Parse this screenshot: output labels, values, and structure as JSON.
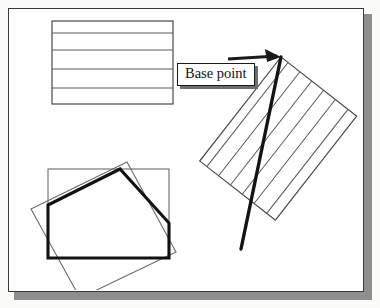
{
  "figure": {
    "name": "base-point-illustration",
    "kind": "cad-technical-drawing",
    "page_background": "#fbfbfa",
    "plate_background": "#ffffff",
    "plate_border_color": "#3b3b3b",
    "plate_shadow_color": "#8e8e8c",
    "ink_color": "#2a2a2a",
    "bold_ink_color": "#111111",
    "thin_ink_color": "#6b6b6b"
  },
  "callout": {
    "label": "Base point",
    "text_color": "#111111",
    "border_color": "#1a1a1a",
    "shadow_color": "#6f6f6d",
    "background": "#ffffff"
  },
  "shapes": {
    "top_rectangle": {
      "name": "horizontal-hatched-rectangle",
      "x": 51,
      "y": 20,
      "width": 121,
      "height": 83,
      "hatch_lines": 4,
      "hatch_angle_deg": 0
    },
    "right_rectangle": {
      "name": "rotated-hatched-rectangle",
      "rotation_deg": -38,
      "hatch_lines": 6,
      "hatch_angle_deg": 90
    },
    "bottom_axis_rectangle": {
      "name": "axis-aligned-outline-rectangle",
      "x": 47,
      "y": 168,
      "width": 121,
      "height": 89
    },
    "bottom_rotated_rectangle": {
      "name": "rotated-outline-rectangle",
      "rotation_deg": -14
    },
    "bold_polygon": {
      "name": "bold-boundary-polygon",
      "sides": 5
    },
    "bold_diagonal": {
      "name": "bold-base-point-line"
    },
    "arrow": {
      "name": "callout-leader-arrow",
      "points_to": "base point vertex"
    }
  },
  "ghost_text": {
    "note": "faint mirrored bleed-through from the reverse side of the scanned page",
    "lines": [
      "the right side to create the Transpose",
      "boundary in the drawing area, as shown in",
      "the area",
      "creating hatch for the hatching boundary",
      "will see the hatch pattern as shown in figure",
      "then choose the Properties button"
    ]
  }
}
